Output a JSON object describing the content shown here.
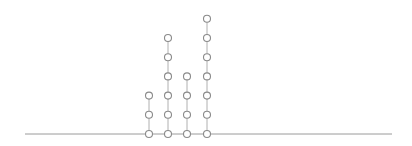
{
  "chart_data": {
    "type": "scatter",
    "subtype": "stacked-dot-plot",
    "title": "",
    "xlabel": "",
    "ylabel": "",
    "categories": [
      "1",
      "2",
      "3",
      "4"
    ],
    "values": [
      3,
      6,
      4,
      7
    ],
    "grid": false,
    "legend": null
  },
  "style": {
    "baseline_color": "#9a9a9a",
    "stem_color": "#b0b0b0",
    "dot_stroke": "#8a8a8a",
    "dot_fill": "#ffffff"
  },
  "layout": {
    "baseline_y": 134,
    "baseline_x0": 25,
    "baseline_x1": 392,
    "column_x": [
      149,
      168,
      187,
      207
    ],
    "dot_spacing": 19.2,
    "dot_radius": 3.5
  }
}
